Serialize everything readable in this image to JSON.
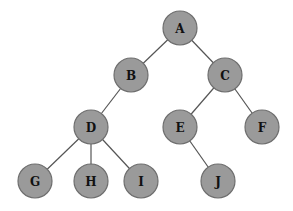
{
  "diagram": {
    "type": "tree",
    "node_radius": 17,
    "colors": {
      "node_fill": "#9a9a9a",
      "node_stroke": "#6e6e6e",
      "edge": "#555555",
      "label": "#111111",
      "background": "#ffffff"
    },
    "nodes": [
      {
        "id": "A",
        "label": "A",
        "x": 180,
        "y": 28
      },
      {
        "id": "B",
        "label": "B",
        "x": 131,
        "y": 75
      },
      {
        "id": "C",
        "label": "C",
        "x": 225,
        "y": 75
      },
      {
        "id": "D",
        "label": "D",
        "x": 91,
        "y": 127
      },
      {
        "id": "E",
        "label": "E",
        "x": 180,
        "y": 127
      },
      {
        "id": "F",
        "label": "F",
        "x": 262,
        "y": 127
      },
      {
        "id": "G",
        "label": "G",
        "x": 35,
        "y": 181
      },
      {
        "id": "H",
        "label": "H",
        "x": 91,
        "y": 181
      },
      {
        "id": "I",
        "label": "I",
        "x": 141,
        "y": 181
      },
      {
        "id": "J",
        "label": "J",
        "x": 218,
        "y": 181
      }
    ],
    "edges": [
      {
        "from": "A",
        "to": "B"
      },
      {
        "from": "A",
        "to": "C"
      },
      {
        "from": "B",
        "to": "D"
      },
      {
        "from": "C",
        "to": "E"
      },
      {
        "from": "C",
        "to": "F"
      },
      {
        "from": "D",
        "to": "G"
      },
      {
        "from": "D",
        "to": "H"
      },
      {
        "from": "D",
        "to": "I"
      },
      {
        "from": "E",
        "to": "J"
      }
    ]
  }
}
